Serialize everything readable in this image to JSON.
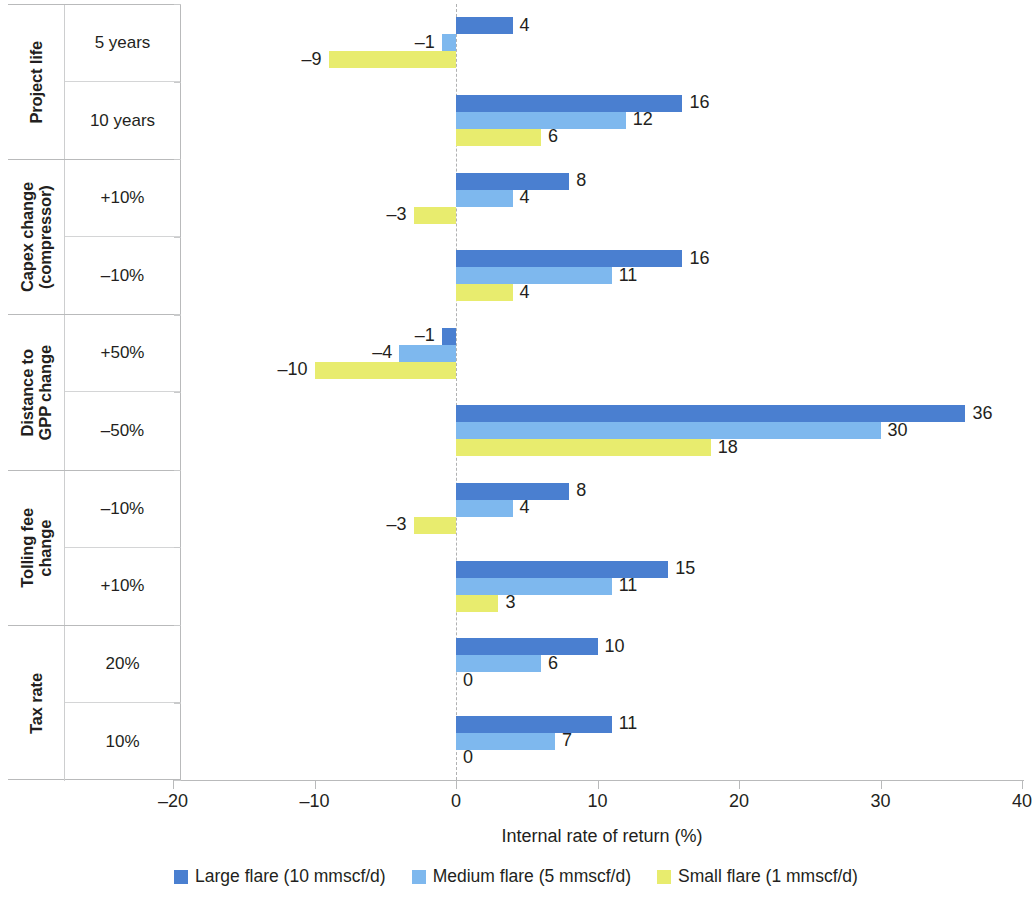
{
  "chart_data": {
    "type": "bar",
    "orientation": "horizontal",
    "title": "",
    "xlabel": "Internal rate of return (%)",
    "ylabel": "",
    "xlim": [
      -20,
      40
    ],
    "xticks": [
      -20,
      -10,
      0,
      10,
      20,
      30,
      40
    ],
    "xtick_labels": [
      "–20",
      "–10",
      "0",
      "10",
      "20",
      "30",
      "40"
    ],
    "grid": false,
    "zero_line": true,
    "legend_position": "bottom",
    "groups": [
      {
        "group_label": "Project life",
        "categories": [
          "5 years",
          "10 years"
        ],
        "values": {
          "large": [
            4,
            16
          ],
          "medium": [
            -1,
            12
          ],
          "small": [
            -9,
            6
          ]
        },
        "labels": {
          "large": [
            "4",
            "16"
          ],
          "medium": [
            "–1",
            "12"
          ],
          "small": [
            "–9",
            "6"
          ]
        }
      },
      {
        "group_label": "Capex change\n(compressor)",
        "categories": [
          "+10%",
          "–10%"
        ],
        "values": {
          "large": [
            8,
            16
          ],
          "medium": [
            4,
            11
          ],
          "small": [
            -3,
            4
          ]
        },
        "labels": {
          "large": [
            "8",
            "16"
          ],
          "medium": [
            "4",
            "11"
          ],
          "small": [
            "–3",
            "4"
          ]
        }
      },
      {
        "group_label": "Distance to\nGPP change",
        "categories": [
          "+50%",
          "–50%"
        ],
        "values": {
          "large": [
            -1,
            36
          ],
          "medium": [
            -4,
            30
          ],
          "small": [
            -10,
            18
          ]
        },
        "labels": {
          "large": [
            "–1",
            "36"
          ],
          "medium": [
            "–4",
            "30"
          ],
          "small": [
            "–10",
            "18"
          ]
        }
      },
      {
        "group_label": "Tolling fee\nchange",
        "categories": [
          "–10%",
          "+10%"
        ],
        "values": {
          "large": [
            8,
            15
          ],
          "medium": [
            4,
            11
          ],
          "small": [
            -3,
            3
          ]
        },
        "labels": {
          "large": [
            "8",
            "15"
          ],
          "medium": [
            "4",
            "11"
          ],
          "small": [
            "–3",
            "3"
          ]
        }
      },
      {
        "group_label": "Tax rate",
        "categories": [
          "20%",
          "10%"
        ],
        "values": {
          "large": [
            10,
            11
          ],
          "medium": [
            6,
            7
          ],
          "small": [
            0,
            0
          ]
        },
        "labels": {
          "large": [
            "10",
            "11"
          ],
          "medium": [
            "6",
            "7"
          ],
          "small": [
            "0",
            "0"
          ]
        }
      }
    ],
    "series": [
      {
        "key": "large",
        "name": "Large flare (10 mmscf/d)",
        "color": "#4a7fd0"
      },
      {
        "key": "medium",
        "name": "Medium flare (5 mmscf/d)",
        "color": "#7eb8ee"
      },
      {
        "key": "small",
        "name": "Small flare (1 mmscf/d)",
        "color": "#e8ec6e"
      }
    ]
  },
  "legend": {
    "items": [
      {
        "label": "Large flare (10 mmscf/d)",
        "color": "#4a7fd0"
      },
      {
        "label": "Medium flare (5 mmscf/d)",
        "color": "#7eb8ee"
      },
      {
        "label": "Small flare (1 mmscf/d)",
        "color": "#e8ec6e"
      }
    ]
  },
  "axis": {
    "x_title": "Internal rate of return (%)"
  }
}
